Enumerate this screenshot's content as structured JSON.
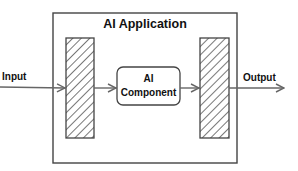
{
  "diagram": {
    "title": "AI Application",
    "input_label": "Input",
    "output_label": "Output",
    "component": {
      "line1": "AI",
      "line2": "Component"
    },
    "colors": {
      "stroke": "#444444",
      "arrow": "#666666",
      "text": "#111111",
      "background": "#ffffff"
    }
  }
}
